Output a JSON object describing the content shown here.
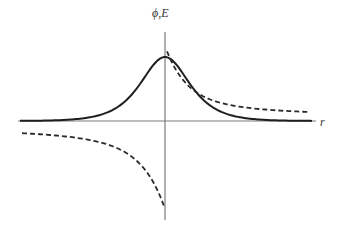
{
  "chart_data": {
    "type": "line",
    "title": "",
    "xlabel": "r",
    "ylabel": "ϕ,E",
    "grid": false,
    "legend": null,
    "axes": {
      "x_range": [
        -1,
        1
      ],
      "y_range": [
        -1,
        1
      ],
      "ticks": "none"
    },
    "series": [
      {
        "name": "ϕ (potential)",
        "style": "solid",
        "description": "symmetric bell-shaped curve peaking at r=0, decaying to 0 on both sides",
        "x": [
          -1.0,
          -0.75,
          -0.5,
          -0.3,
          -0.15,
          0.0,
          0.15,
          0.3,
          0.5,
          0.75,
          1.0
        ],
        "y": [
          0.01,
          0.03,
          0.1,
          0.3,
          0.6,
          0.72,
          0.6,
          0.3,
          0.1,
          0.03,
          0.01
        ]
      },
      {
        "name": "E (field)",
        "style": "dashed",
        "description": "antisymmetric curve: positive for r>0 decaying toward small positive value, negative for r<0 approaching small negative value; discontinuous at r=0",
        "x": [
          -1.0,
          -0.75,
          -0.5,
          -0.3,
          -0.15,
          -0.01,
          0.01,
          0.15,
          0.3,
          0.5,
          0.75,
          1.0
        ],
        "y": [
          -0.2,
          -0.24,
          -0.33,
          -0.47,
          -0.65,
          -0.9,
          0.8,
          0.4,
          0.24,
          0.16,
          0.12,
          0.08
        ]
      }
    ]
  },
  "labels": {
    "y_axis": "ϕ,E",
    "x_axis": "r"
  }
}
